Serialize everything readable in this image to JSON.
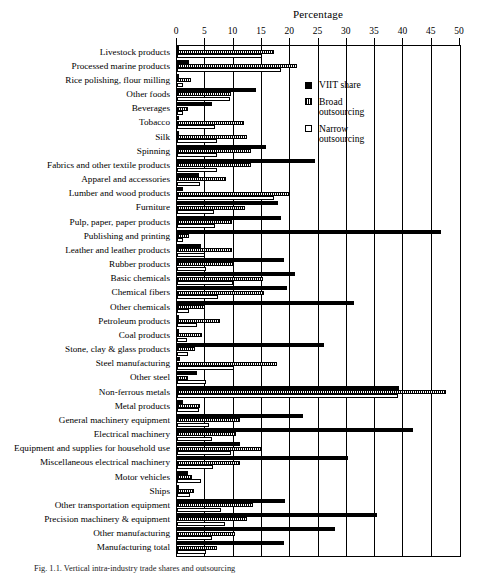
{
  "chart_data": {
    "type": "bar",
    "orientation": "horizontal",
    "title": "Percentage",
    "xlabel": "Percentage",
    "ylabel": "",
    "xlim": [
      0,
      50
    ],
    "xticks": [
      0,
      5,
      10,
      15,
      20,
      25,
      30,
      35,
      40,
      45,
      50
    ],
    "grid": true,
    "grid_axis": "x",
    "legend_position": "upper right inside plot",
    "categories": [
      "Livestock products",
      "Processed marine products",
      "Rice polishing, flour milling",
      "Other foods",
      "Beverages",
      "Tobacco",
      "Silk",
      "Spinning",
      "Fabrics and other textile products",
      "Apparel and accessories",
      "Lumber and wood products",
      "Furniture",
      "Pulp, paper, paper products",
      "Publishing and printing",
      "Leather and leather products",
      "Rubber products",
      "Basic chemicals",
      "Chemical fibers",
      "Other chemicals",
      "Petroleum products",
      "Coal products",
      "Stone, clay & glass products",
      "Steel manufacturing",
      "Other steel",
      "Non-ferrous metals",
      "Metal products",
      "General machinery equipment",
      "Electrical machinery",
      "Equipment and supplies for household use",
      "Miscellaneous electrical machinery",
      "Motor vehicles",
      "Ships",
      "Other transportation equipment",
      "Precision machinery & equipment",
      "Other manufacturing",
      "Manufacturing total"
    ],
    "series": [
      {
        "name": "VIIT share",
        "pattern": "solid-black",
        "values": [
          0.2,
          2.2,
          0.3,
          13.9,
          6.1,
          0.2,
          0.3,
          15.7,
          24.3,
          3.9,
          1.0,
          17.8,
          18.3,
          46.6,
          4.3,
          18.9,
          20.8,
          19.4,
          31.3,
          0.4,
          0.2,
          25.9,
          0.6,
          3.6,
          39.3,
          1.0,
          22.3,
          41.7,
          11.1,
          30.2,
          2.0,
          0.3,
          19.0,
          35.3,
          27.9,
          18.9
        ]
      },
      {
        "name": "Broad outsourcing",
        "pattern": "hatched",
        "values": [
          17.2,
          21.2,
          2.4,
          9.5,
          2.0,
          11.9,
          12.3,
          13.0,
          13.0,
          8.6,
          19.7,
          12.0,
          9.8,
          2.2,
          9.8,
          10.1,
          15.2,
          15.3,
          4.9,
          7.6,
          4.4,
          3.2,
          17.6,
          2.0,
          47.5,
          4.1,
          11.2,
          10.4,
          15.1,
          11.1,
          2.6,
          3.0,
          13.5,
          12.3,
          10.3,
          7.1
        ]
      },
      {
        "name": "Narrow outsourcing",
        "pattern": "white-outline",
        "values": [
          15.1,
          18.3,
          1.1,
          9.4,
          1.0,
          6.8,
          7.0,
          7.0,
          7.0,
          4.1,
          17.1,
          6.6,
          6.7,
          1.1,
          5.0,
          5.1,
          9.9,
          7.3,
          2.1,
          3.6,
          1.8,
          2.0,
          10.1,
          5.2,
          39.0,
          3.8,
          5.6,
          6.2,
          9.5,
          6.4,
          4.2,
          2.3,
          7.7,
          8.5,
          6.1,
          5.2
        ]
      }
    ]
  },
  "legend": {
    "items": [
      {
        "label": "VIIT share",
        "swatch": "solid-black-swatch"
      },
      {
        "label": "Broad\noutsourcing",
        "label_line1": "Broad",
        "label_line2": "outsourcing",
        "swatch": "hatched-swatch"
      },
      {
        "label": "Narrow\noutsourcing",
        "label_line1": "Narrow",
        "label_line2": "outsourcing",
        "swatch": "white-swatch"
      }
    ]
  },
  "caption": {
    "text": "Fig. 1.1.  Vertical intra-industry trade shares and outsourcing"
  }
}
